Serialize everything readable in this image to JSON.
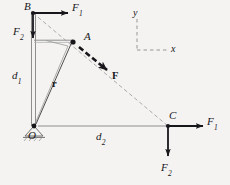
{
  "figure": {
    "type": "free-body-diagram",
    "background_color": "#f4f3f1",
    "ink_color": "#17161a",
    "member_color": "#8a8a8a",
    "dashed_color": "#9b9b9b",
    "canvas": {
      "width": 230,
      "height": 185
    }
  },
  "points": [
    {
      "id": "B",
      "label": "B",
      "x": 33,
      "y": 13,
      "label_x": 24,
      "label_y": 2,
      "has_dot": true
    },
    {
      "id": "A",
      "label": "A",
      "x": 73,
      "y": 42,
      "label_x": 84,
      "label_y": 33,
      "has_dot": true
    },
    {
      "id": "C",
      "label": "C",
      "x": 168,
      "y": 126,
      "label_x": 170,
      "label_y": 112,
      "has_dot": true
    },
    {
      "id": "O",
      "label": "O",
      "x": 34,
      "y": 126,
      "label_x": 28,
      "label_y": 131,
      "has_dot": true
    }
  ],
  "vectors": [
    {
      "id": "F1-at-B",
      "label": "F",
      "subscript": "1",
      "from_x": 33,
      "from_y": 13,
      "to_x": 68,
      "to_y": 13,
      "label_x": 73,
      "label_y": 4,
      "weight": "bold"
    },
    {
      "id": "F2-at-B",
      "label": "F",
      "subscript": "2",
      "from_x": 33,
      "from_y": 13,
      "to_x": 33,
      "to_y": 38,
      "label_x": 16,
      "label_y": 27,
      "weight": "bold"
    },
    {
      "id": "F1-at-C",
      "label": "F",
      "subscript": "1",
      "from_x": 168,
      "from_y": 126,
      "to_x": 203,
      "to_y": 126,
      "label_x": 208,
      "label_y": 118,
      "weight": "bold"
    },
    {
      "id": "F2-at-C",
      "label": "F",
      "subscript": "2",
      "from_x": 168,
      "from_y": 126,
      "to_x": 168,
      "to_y": 157,
      "label_x": 162,
      "label_y": 161,
      "weight": "bold"
    },
    {
      "id": "F-at-A",
      "label": "F",
      "subscript": "",
      "from_x": 78,
      "from_y": 47,
      "to_x": 106,
      "to_y": 69,
      "label_x": 112,
      "label_y": 72,
      "weight": "bold",
      "style": "dashed-thick"
    },
    {
      "id": "r-vector",
      "label": "r",
      "subscript": "",
      "from_x": 34,
      "from_y": 126,
      "to_x": 73,
      "to_y": 42,
      "label_x": 53,
      "label_y": 80,
      "weight": "bold",
      "style": "thin-line"
    }
  ],
  "dimensions": [
    {
      "id": "d1",
      "label": "d",
      "subscript": "1",
      "label_x": 14,
      "label_y": 72,
      "orientation": "vertical"
    },
    {
      "id": "d2",
      "label": "d",
      "subscript": "2",
      "label_x": 97,
      "label_y": 132,
      "orientation": "horizontal"
    }
  ],
  "axes_legend": {
    "id": "coordinate-axes",
    "corner_x": 137,
    "corner_y": 50,
    "y_top": 18,
    "x_right": 167,
    "y_label": "y",
    "x_label": "x",
    "y_label_x": 133,
    "y_label_y": 8,
    "x_label_x": 172,
    "x_label_y": 44,
    "style": "dashed"
  },
  "members": [
    {
      "id": "column-O-to-B",
      "type": "double-line-column",
      "x1": 33,
      "y1": 13,
      "x2": 33,
      "y2": 126
    },
    {
      "id": "arm-B-level-to-A",
      "type": "horizontal-arm",
      "x1": 34,
      "y1": 41,
      "x2": 73,
      "y2": 41
    },
    {
      "id": "base-O-to-C",
      "type": "horizontal-base",
      "x1": 34,
      "y1": 126,
      "x2": 178,
      "y2": 126
    },
    {
      "id": "brace-A-to-O",
      "type": "diagonal-brace",
      "x1": 68,
      "y1": 45,
      "x2": 34,
      "y2": 126
    },
    {
      "id": "line-of-action-B-to-C",
      "type": "dashed-line",
      "x1": 33,
      "y1": 13,
      "x2": 168,
      "y2": 126
    }
  ],
  "support": {
    "id": "pin-support-at-O",
    "label": "pin-support",
    "x": 34,
    "y": 126,
    "width": 18,
    "height": 10
  }
}
